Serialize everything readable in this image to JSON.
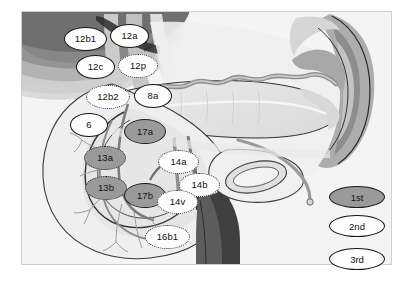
{
  "figure": {
    "background_color": "#ffffff",
    "image_frame": {
      "x": 21,
      "y": 11,
      "width": 371,
      "height": 254
    }
  },
  "nodes": [
    {
      "id": "12b1",
      "label": "12b1",
      "tier": "3rd",
      "x": 64,
      "y": 27,
      "w": 43,
      "h": 24
    },
    {
      "id": "12a",
      "label": "12a",
      "tier": "3rd",
      "x": 110,
      "y": 24,
      "w": 39,
      "h": 24
    },
    {
      "id": "12c",
      "label": "12c",
      "tier": "3rd",
      "x": 76,
      "y": 55,
      "w": 39,
      "h": 24
    },
    {
      "id": "12p",
      "label": "12p",
      "tier": "2nd",
      "x": 118,
      "y": 54,
      "w": 40,
      "h": 24
    },
    {
      "id": "12b2",
      "label": "12b2",
      "tier": "2nd",
      "x": 86,
      "y": 85,
      "w": 44,
      "h": 24
    },
    {
      "id": "8a",
      "label": "8a",
      "tier": "3rd",
      "x": 134,
      "y": 84,
      "w": 38,
      "h": 24
    },
    {
      "id": "6",
      "label": "6",
      "tier": "3rd",
      "x": 70,
      "y": 113,
      "w": 38,
      "h": 24
    },
    {
      "id": "17a",
      "label": "17a",
      "tier": "1st",
      "x": 124,
      "y": 119,
      "w": 42,
      "h": 25
    },
    {
      "id": "13a",
      "label": "13a",
      "tier": "1st-dotted",
      "x": 84,
      "y": 146,
      "w": 42,
      "h": 24
    },
    {
      "id": "14a",
      "label": "14a",
      "tier": "2nd",
      "x": 158,
      "y": 150,
      "w": 41,
      "h": 24
    },
    {
      "id": "14b",
      "label": "14b",
      "tier": "2nd",
      "x": 179,
      "y": 173,
      "w": 41,
      "h": 24
    },
    {
      "id": "13b",
      "label": "13b",
      "tier": "1st-dotted",
      "x": 85,
      "y": 176,
      "w": 42,
      "h": 24
    },
    {
      "id": "17b",
      "label": "17b",
      "tier": "1st",
      "x": 124,
      "y": 183,
      "w": 42,
      "h": 25
    },
    {
      "id": "14v",
      "label": "14v",
      "tier": "2nd",
      "x": 157,
      "y": 190,
      "w": 41,
      "h": 24
    },
    {
      "id": "16b1",
      "label": "16b1",
      "tier": "2nd",
      "x": 145,
      "y": 225,
      "w": 45,
      "h": 24
    }
  ],
  "legend": {
    "title": "Node tier legend",
    "items": [
      {
        "id": "legend-1",
        "label": "1st",
        "tier": "1st",
        "fill": "#9a9a9a",
        "border": "solid"
      },
      {
        "id": "legend-2",
        "label": "2nd",
        "tier": "2nd",
        "fill": "#fdfdfd",
        "border": "solid"
      },
      {
        "id": "legend-3",
        "label": "3rd",
        "tier": "3rd",
        "fill": "#fdfdfd",
        "border": "solid"
      }
    ]
  },
  "colors": {
    "tier1_fill": "#9a9a9a",
    "tier2_fill": "#fdfdfd",
    "tier3_fill": "#fdfdfd",
    "outline": "#1b1b1b",
    "page_background": "#ffffff"
  }
}
